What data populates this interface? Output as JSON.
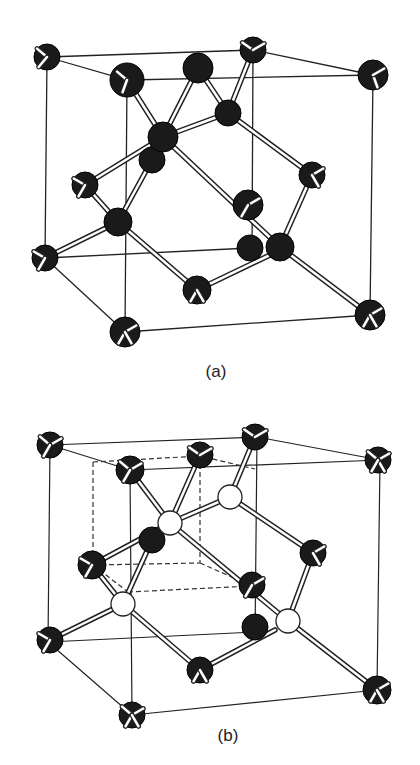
{
  "figures": [
    {
      "id": "a",
      "caption": "(a)",
      "description": "Diamond cubic crystal structure",
      "atom_color": "#1a1a1a"
    },
    {
      "id": "b",
      "caption": "(b)",
      "description": "Diamond structure as two interpenetrating FCC lattices, one sublattice shown with open (white) atoms and inner cube dashed",
      "atom_color_dark": "#1a1a1a",
      "atom_color_open": "#ffffff"
    }
  ]
}
